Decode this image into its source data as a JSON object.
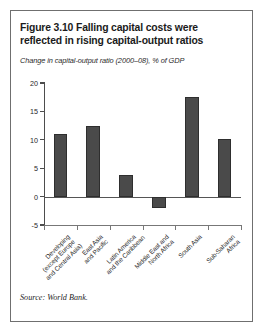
{
  "figure": {
    "title": "Figure 3.10  Falling capital costs were reflected in rising capital-output ratios",
    "source": "Source: World Bank."
  },
  "chart_data": {
    "type": "bar",
    "title": "Figure 3.10  Falling capital costs were reflected in rising capital-output ratios",
    "subtitle": "Change in capital-output ratio (2000–08), % of GDP",
    "xlabel": "",
    "ylabel": "",
    "ylim": [
      -5,
      20
    ],
    "yticks": [
      20,
      15,
      10,
      5,
      0,
      -5
    ],
    "ytick_labels": [
      "20",
      "15",
      "10",
      "5",
      "0",
      "-5"
    ],
    "grid": false,
    "legend": null,
    "bar_color": "#4a4a4a",
    "categories": [
      "Developing (except Europe and Central Asia)",
      "East Asia and Pacific",
      "Latin America and the Caribbean",
      "Middle East and North Africa",
      "South Asia",
      "Sub-Saharan Africa"
    ],
    "category_lines": [
      [
        "Developing",
        "(except Europe",
        "and Central Asia)"
      ],
      [
        "East Asia",
        "and Pacific"
      ],
      [
        "Latin America",
        "and the Caribbean"
      ],
      [
        "Middle East and",
        "North Africa"
      ],
      [
        "South Asia"
      ],
      [
        "Sub-Saharan",
        "Africa"
      ]
    ],
    "values": [
      11.1,
      12.4,
      3.8,
      -2.0,
      17.5,
      10.1
    ]
  }
}
